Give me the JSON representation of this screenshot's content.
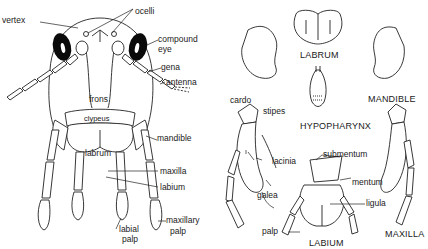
{
  "head_view": {
    "labels": {
      "vertex": "vertex",
      "ocelli": "ocelli",
      "compound_eye_1": "compound",
      "compound_eye_2": "eye",
      "gena": "gena",
      "antenna": "antenna",
      "frons": "frons",
      "clypeus": "clypeus",
      "mandible": "mandible",
      "labrum": "labrum",
      "maxilla": "maxilla",
      "labium": "labium",
      "labial_palp_1": "labial",
      "labial_palp_2": "palp",
      "maxillary_palp_1": "maxillary",
      "maxillary_palp_2": "palp"
    }
  },
  "mouthparts": {
    "captions": {
      "labrum": "LABRUM",
      "mandible": "MANDIBLE",
      "hypopharynx": "HYPOPHARYNX",
      "maxilla": "MAXILLA",
      "labium": "LABIUM"
    },
    "labels": {
      "cardo": "cardo",
      "stipes": "stipes",
      "lacinia": "lacinia",
      "galea": "galea",
      "palp": "palp",
      "submentum": "submentum",
      "mentum": "mentum",
      "ligula": "ligula"
    }
  }
}
